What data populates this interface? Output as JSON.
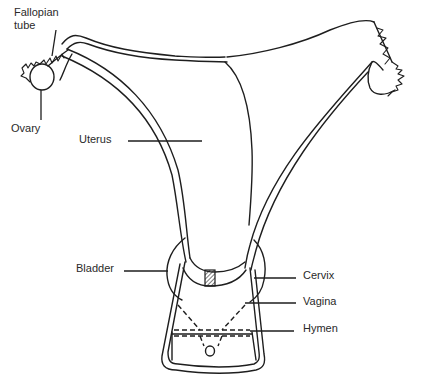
{
  "diagram": {
    "labels": {
      "fallopian_tube_line1": "Fallopian",
      "fallopian_tube_line2": "tube",
      "ovary": "Ovary",
      "uterus": "Uterus",
      "bladder": "Bladder",
      "cervix": "Cervix",
      "vagina": "Vagina",
      "hymen": "Hymen"
    },
    "colors": {
      "ink": "#1e1e1e",
      "background": "#ffffff",
      "text": "#2a2a2a"
    }
  }
}
